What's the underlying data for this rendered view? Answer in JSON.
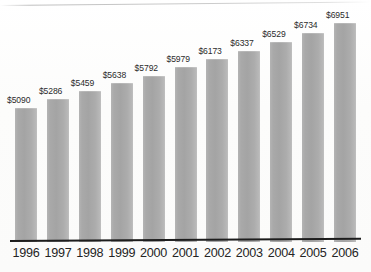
{
  "chart_data": {
    "type": "bar",
    "title": "",
    "subtitle": "",
    "xlabel": "",
    "ylabel": "",
    "categories": [
      "1996",
      "1997",
      "1998",
      "1999",
      "2000",
      "2001",
      "2002",
      "2003",
      "2004",
      "2005",
      "2006"
    ],
    "values": [
      5090,
      5286,
      5459,
      5638,
      5792,
      5979,
      6173,
      6337,
      6529,
      6734,
      6951
    ],
    "value_labels": [
      "$5090",
      "$5286",
      "$5459",
      "$5638",
      "$5792",
      "$5979",
      "$6173",
      "$6337",
      "$6529",
      "$6734",
      "$6951"
    ],
    "ylim": [
      0,
      6951
    ],
    "grid": false,
    "legend": null,
    "series": [
      {
        "name": "",
        "values": [
          5090,
          5286,
          5459,
          5638,
          5792,
          5979,
          6173,
          6337,
          6529,
          6734,
          6951
        ]
      }
    ],
    "annotations": []
  },
  "style": {
    "bar_color": "#a8a8a8",
    "bar_edge_color": "#c2c2c2",
    "axis_color": "#1d1d1d",
    "label_color": "#2b2b2b",
    "tick_label_color": "#242424",
    "background": "#fdfdfc"
  },
  "geometry": {
    "plot_left": 15,
    "plot_right": 360,
    "baseline_y": 241,
    "bar_width": 22,
    "bar_pitch": 31.9,
    "top_of_max_bar_y": 22,
    "value_label_offset_y": 11
  }
}
